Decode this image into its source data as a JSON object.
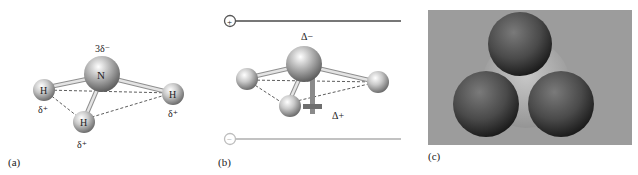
{
  "figure": {
    "panels": [
      {
        "id": "a",
        "caption": "(a)",
        "central_atom": {
          "symbol": "N",
          "charge_label": "3δ⁻"
        },
        "outer_atoms": [
          {
            "symbol": "H",
            "charge_label": "δ⁺",
            "position": "left"
          },
          {
            "symbol": "H",
            "charge_label": "δ⁺",
            "position": "front"
          },
          {
            "symbol": "H",
            "charge_label": "δ⁺",
            "position": "right"
          }
        ]
      },
      {
        "id": "b",
        "caption": "(b)",
        "top_plate": {
          "sign": "+",
          "color": "#777777"
        },
        "bottom_plate": {
          "sign": "−",
          "color": "#bdbdbd"
        },
        "negative_label": "Δ−",
        "positive_label": "Δ+",
        "dipole_color": "#8a8a8a"
      },
      {
        "id": "c",
        "caption": "(c)",
        "style": "space-filling model",
        "background_color": "#9c9c9c",
        "center_sphere_color": "#b4b4b4",
        "outer_sphere_color": "#555555"
      }
    ]
  },
  "colors": {
    "atom_highlight": "#ffffff",
    "atom_mid": "#c8c8c8",
    "atom_shadow": "#6e6e6e",
    "bond": "#d9d9d9",
    "bond_edge": "#8f8f8f",
    "dash": "#333333"
  }
}
